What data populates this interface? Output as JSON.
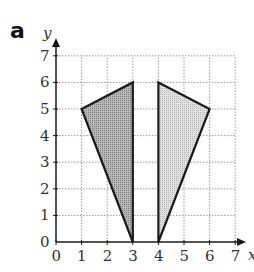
{
  "figure": {
    "part_label": "a",
    "x_axis_label": "x",
    "y_axis_label": "y",
    "x_ticks": [
      "0",
      "1",
      "2",
      "3",
      "4",
      "5",
      "6",
      "7"
    ],
    "y_ticks": [
      "0",
      "1",
      "2",
      "3",
      "4",
      "5",
      "6",
      "7"
    ],
    "grid": "dotted",
    "colors": {
      "left_fill": "#a9a9a9",
      "right_fill": "#d4d4d4",
      "stroke": "#1a1a1a",
      "grid": "#9a9a9a"
    },
    "shapes": [
      {
        "name": "left-triangle",
        "vertices": [
          [
            1,
            5
          ],
          [
            3,
            6
          ],
          [
            3,
            0
          ]
        ],
        "shade": "dark"
      },
      {
        "name": "right-triangle",
        "vertices": [
          [
            4,
            6
          ],
          [
            6,
            5
          ],
          [
            4,
            0
          ]
        ],
        "shade": "light"
      }
    ]
  }
}
